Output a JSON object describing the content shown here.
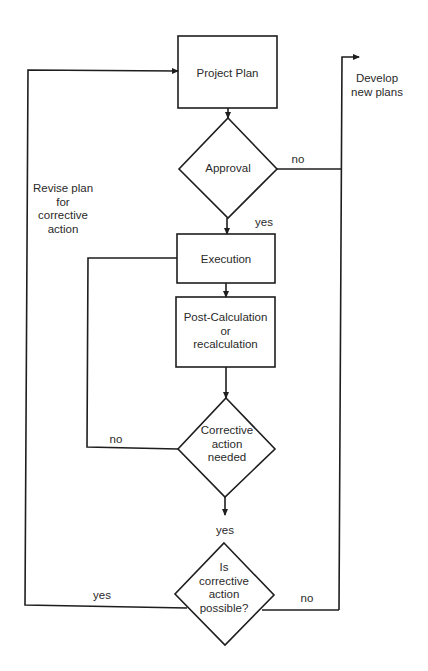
{
  "diagram": {
    "type": "flowchart",
    "nodes": {
      "project_plan": {
        "shape": "rect",
        "label": "Project Plan"
      },
      "approval": {
        "shape": "diamond",
        "label": "Approval"
      },
      "execution": {
        "shape": "rect",
        "label": "Execution"
      },
      "post_calc": {
        "shape": "rect",
        "label": "Post-Calculation\nor\nrecalculation"
      },
      "corrective_needed": {
        "shape": "diamond",
        "label": "Corrective\naction\nneeded"
      },
      "corrective_possible": {
        "shape": "diamond",
        "label": "Is\ncorrective\naction\npossible?"
      }
    },
    "annotations": {
      "develop_new_plans": "Develop\nnew plans",
      "revise_plan": "Revise plan\nfor\ncorrective\naction"
    },
    "edge_labels": {
      "approval_no": "no",
      "approval_yes": "yes",
      "needed_no": "no",
      "needed_yes": "yes",
      "possible_yes": "yes",
      "possible_no": "no"
    },
    "edges": [
      {
        "from": "project_plan",
        "to": "approval"
      },
      {
        "from": "approval",
        "to": "develop_new_plans",
        "label": "no"
      },
      {
        "from": "approval",
        "to": "execution",
        "label": "yes"
      },
      {
        "from": "execution",
        "to": "post_calc"
      },
      {
        "from": "post_calc",
        "to": "corrective_needed"
      },
      {
        "from": "corrective_needed",
        "to": "execution",
        "label": "no"
      },
      {
        "from": "corrective_needed",
        "to": "corrective_possible",
        "label": "yes"
      },
      {
        "from": "corrective_possible",
        "to": "project_plan",
        "label": "yes",
        "via": "Revise plan for corrective action"
      },
      {
        "from": "corrective_possible",
        "to": "develop_new_plans",
        "label": "no"
      }
    ],
    "colors": {
      "stroke": "#1e1e1e",
      "text": "#2a2a2a",
      "background": "#ffffff"
    }
  }
}
